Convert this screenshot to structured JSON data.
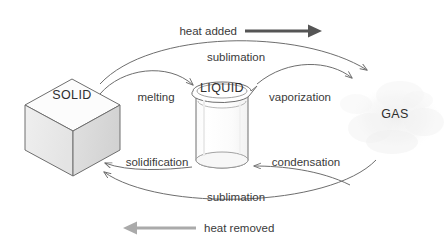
{
  "diagram": {
    "background_color": "#ffffff",
    "states": {
      "solid": {
        "label": "SOLID",
        "icon": "cube-icon"
      },
      "liquid": {
        "label": "LIQUID",
        "icon": "beaker-icon"
      },
      "gas": {
        "label": "GAS",
        "icon": "cloud-icon"
      }
    },
    "transitions": {
      "melting": "melting",
      "vaporization": "vaporization",
      "sublimation_top": "sublimation",
      "condensation": "condensation",
      "solidification": "solidification",
      "sublimation_bottom": "sublimation"
    },
    "heat": {
      "added": "heat added",
      "removed": "heat removed"
    },
    "colors": {
      "stroke": "#6e6e6e",
      "text": "#3a3a3a",
      "heat_added_arrow": "#555555",
      "heat_removed_arrow": "#aaaaaa",
      "cube_top": "#fbfbfb",
      "cube_left": "#ededed",
      "cube_right": "#dcdcdc",
      "cloud": "#f4f4f4"
    }
  }
}
